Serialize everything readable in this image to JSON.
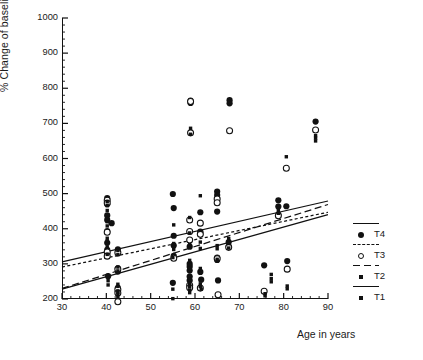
{
  "chart_data": {
    "type": "scatter",
    "title": "",
    "xlabel": "Age in years",
    "ylabel": "% Change of baseline values",
    "xlim": [
      30,
      90
    ],
    "ylim": [
      200,
      1000
    ],
    "xticks": [
      30,
      40,
      50,
      60,
      70,
      80,
      90
    ],
    "yticks": [
      200,
      300,
      400,
      500,
      600,
      700,
      800,
      900,
      1000
    ],
    "xtick_labels": [
      "30",
      "40",
      "50",
      "60",
      "70",
      "80",
      "90"
    ],
    "ytick_labels": [
      "200",
      "300",
      "400",
      "500",
      "600",
      "700",
      "800",
      "900",
      "1000"
    ],
    "x_minor_step": 2,
    "y_minor_step": 20,
    "grid": false,
    "legend_position": "right",
    "marker_color": "#111111",
    "line_color": "#111111",
    "series": [
      {
        "name": "T4",
        "label": "T4",
        "marker": "filled-circle",
        "line_style": "solid",
        "points": [
          [
            40.2,
            487
          ],
          [
            40.2,
            470
          ],
          [
            40.2,
            438
          ],
          [
            40.2,
            425
          ],
          [
            40.2,
            393
          ],
          [
            40.2,
            360
          ],
          [
            40.2,
            340
          ],
          [
            40.2,
            331
          ],
          [
            41.2,
            416
          ],
          [
            40.4,
            265
          ],
          [
            42.6,
            341
          ],
          [
            42.6,
            287
          ],
          [
            42.6,
            278
          ],
          [
            42.6,
            232
          ],
          [
            42.6,
            222
          ],
          [
            55.0,
            499
          ],
          [
            55.2,
            459
          ],
          [
            55.2,
            380
          ],
          [
            55.2,
            352
          ],
          [
            55.2,
            323
          ],
          [
            55.0,
            246
          ],
          [
            58.8,
            349
          ],
          [
            58.8,
            300
          ],
          [
            58.8,
            292
          ],
          [
            58.8,
            281
          ],
          [
            58.8,
            264
          ],
          [
            58.8,
            253
          ],
          [
            59.0,
            765
          ],
          [
            59.0,
            758
          ],
          [
            61.2,
            447
          ],
          [
            61.2,
            392
          ],
          [
            61.2,
            388
          ],
          [
            61.2,
            277
          ],
          [
            61.4,
            255
          ],
          [
            65.0,
            506
          ],
          [
            65.0,
            496
          ],
          [
            65.0,
            449
          ],
          [
            65.0,
            318
          ],
          [
            65.0,
            311
          ],
          [
            65.2,
            253
          ],
          [
            67.8,
            766
          ],
          [
            67.8,
            757
          ],
          [
            67.6,
            362
          ],
          [
            67.6,
            350
          ],
          [
            75.6,
            296
          ],
          [
            78.8,
            481
          ],
          [
            78.8,
            463
          ],
          [
            78.8,
            440
          ],
          [
            80.6,
            464
          ],
          [
            80.8,
            308
          ],
          [
            87.2,
            705
          ]
        ]
      },
      {
        "name": "T3",
        "label": "T3",
        "marker": "open-circle",
        "line_style": "short-dash",
        "points": [
          [
            40.2,
            481
          ],
          [
            40.2,
            473
          ],
          [
            40.2,
            390
          ],
          [
            40.2,
            334
          ],
          [
            40.2,
            322
          ],
          [
            42.6,
            332
          ],
          [
            42.6,
            285
          ],
          [
            42.6,
            227
          ],
          [
            42.6,
            217
          ],
          [
            42.6,
            192
          ],
          [
            55.2,
            316
          ],
          [
            58.8,
            425
          ],
          [
            58.8,
            392
          ],
          [
            58.8,
            368
          ],
          [
            58.8,
            239
          ],
          [
            58.8,
            232
          ],
          [
            59.0,
            673
          ],
          [
            59.0,
            762
          ],
          [
            61.2,
            416
          ],
          [
            61.2,
            384
          ],
          [
            61.2,
            231
          ],
          [
            65.0,
            485
          ],
          [
            65.0,
            474
          ],
          [
            65.0,
            315
          ],
          [
            65.2,
            212
          ],
          [
            67.8,
            679
          ],
          [
            67.6,
            347
          ],
          [
            75.6,
            222
          ],
          [
            78.8,
            437
          ],
          [
            80.6,
            572
          ],
          [
            80.8,
            285
          ],
          [
            87.2,
            681
          ]
        ]
      },
      {
        "name": "T2",
        "label": "T2",
        "marker": "small-square",
        "line_style": "long-dash",
        "points": [
          [
            40.2,
            477
          ],
          [
            40.2,
            452
          ],
          [
            40.2,
            420
          ],
          [
            40.2,
            373
          ],
          [
            40.2,
            348
          ],
          [
            40.4,
            240
          ],
          [
            42.6,
            338
          ],
          [
            42.6,
            280
          ],
          [
            42.6,
            236
          ],
          [
            42.6,
            223
          ],
          [
            42.6,
            207
          ],
          [
            55.2,
            411
          ],
          [
            55.2,
            358
          ],
          [
            55.2,
            341
          ],
          [
            55.0,
            201
          ],
          [
            58.8,
            432
          ],
          [
            58.8,
            355
          ],
          [
            58.8,
            244
          ],
          [
            58.8,
            236
          ],
          [
            58.8,
            218
          ],
          [
            59.0,
            686
          ],
          [
            59.0,
            669
          ],
          [
            61.2,
            494
          ],
          [
            61.2,
            344
          ],
          [
            61.2,
            243
          ],
          [
            61.4,
            228
          ],
          [
            65.0,
            352
          ],
          [
            65.0,
            313
          ],
          [
            67.6,
            372
          ],
          [
            67.6,
            358
          ],
          [
            75.8,
            215
          ],
          [
            77.2,
            270
          ],
          [
            77.2,
            249
          ],
          [
            78.8,
            452
          ],
          [
            80.6,
            605
          ],
          [
            80.8,
            237
          ],
          [
            87.2,
            665
          ],
          [
            87.2,
            650
          ]
        ]
      },
      {
        "name": "T1",
        "label": "T1",
        "marker": "small-square",
        "line_style": "solid",
        "points": [
          [
            40.2,
            466
          ],
          [
            40.2,
            408
          ],
          [
            40.2,
            365
          ],
          [
            40.2,
            327
          ],
          [
            40.4,
            252
          ],
          [
            42.6,
            326
          ],
          [
            42.6,
            291
          ],
          [
            42.6,
            242
          ],
          [
            42.6,
            219
          ],
          [
            42.6,
            213
          ],
          [
            55.0,
            318
          ],
          [
            55.0,
            228
          ],
          [
            58.8,
            388
          ],
          [
            58.8,
            310
          ],
          [
            58.8,
            287
          ],
          [
            58.8,
            226
          ],
          [
            61.2,
            362
          ],
          [
            61.2,
            287
          ],
          [
            61.2,
            236
          ],
          [
            65.0,
            343
          ],
          [
            65.0,
            308
          ],
          [
            67.6,
            345
          ],
          [
            75.8,
            209
          ],
          [
            77.2,
            258
          ],
          [
            78.8,
            444
          ],
          [
            80.8,
            229
          ],
          [
            87.2,
            658
          ]
        ]
      }
    ],
    "regression_lines": [
      {
        "name": "T4",
        "style": "solid",
        "x0": 30,
        "y0": 306,
        "x1": 90,
        "y1": 479
      },
      {
        "name": "T3",
        "style": "short-dash",
        "x0": 30,
        "y0": 291,
        "x1": 90,
        "y1": 447
      },
      {
        "name": "T2",
        "style": "long-dash",
        "x0": 30,
        "y0": 230,
        "x1": 90,
        "y1": 469
      },
      {
        "name": "T1",
        "style": "solid",
        "x0": 30,
        "y0": 228,
        "x1": 90,
        "y1": 440
      }
    ]
  },
  "axes": {
    "x_title": "Age in years",
    "y_title": "% Change of baseline values"
  },
  "legend": {
    "items": [
      {
        "label": "T4",
        "marker": "filled-circle",
        "line_style": "solid"
      },
      {
        "label": "T3",
        "marker": "open-circle",
        "line_style": "short-dash"
      },
      {
        "label": "T2",
        "marker": "small-square",
        "line_style": "long-dash"
      },
      {
        "label": "T1",
        "marker": "small-square",
        "line_style": "solid"
      }
    ]
  }
}
